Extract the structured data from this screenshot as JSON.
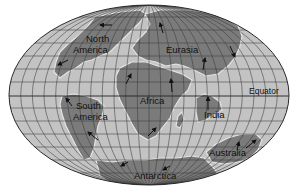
{
  "map": {
    "projection": "mollweide-style world map",
    "colors": {
      "ocean": "#c3c3c3",
      "land": "#7b7b7b",
      "grid": "#3a3a3a",
      "outline": "#2a2a2a",
      "coast_halo": "#e4e4e4",
      "text": "#111111"
    },
    "labels": {
      "north_america_1": "North",
      "north_america_2": "America",
      "eurasia": "Eurasia",
      "africa": "Africa",
      "south_america_1": "South",
      "south_america_2": "America",
      "india": "India",
      "australia": "Australia",
      "antarctica": "Antarctica",
      "equator": "Equator"
    },
    "continents": [
      {
        "name": "North America",
        "motion_arrows": 2
      },
      {
        "name": "Eurasia",
        "motion_arrows": 3
      },
      {
        "name": "Africa",
        "motion_arrows": 3
      },
      {
        "name": "South America",
        "motion_arrows": 2
      },
      {
        "name": "India",
        "motion_arrows": 1
      },
      {
        "name": "Australia",
        "motion_arrows": 2
      },
      {
        "name": "Antarctica",
        "motion_arrows": 2
      }
    ]
  }
}
